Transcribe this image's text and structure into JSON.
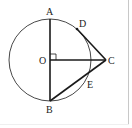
{
  "figure": {
    "type": "geometry",
    "colors": {
      "stroke": "#1a1a1a",
      "circle": "#333333",
      "background": "#ffffff",
      "border": "#c8c8c8"
    },
    "circle": {
      "cx": 50,
      "cy": 60,
      "r": 41
    },
    "points": {
      "A": {
        "label": "A",
        "x": 50,
        "y": 19
      },
      "B": {
        "label": "B",
        "x": 50,
        "y": 101
      },
      "O": {
        "label": "O",
        "x": 50,
        "y": 60
      },
      "C": {
        "label": "C",
        "x": 106,
        "y": 60
      },
      "D": {
        "label": "D",
        "x": 77,
        "y": 29
      },
      "E": {
        "label": "E",
        "x": 87,
        "y": 79
      }
    },
    "segments": [
      {
        "from": "A",
        "to": "B"
      },
      {
        "from": "O",
        "to": "C"
      },
      {
        "from": "D",
        "to": "C"
      },
      {
        "from": "B",
        "to": "C"
      }
    ],
    "right_angle_at": "O"
  }
}
